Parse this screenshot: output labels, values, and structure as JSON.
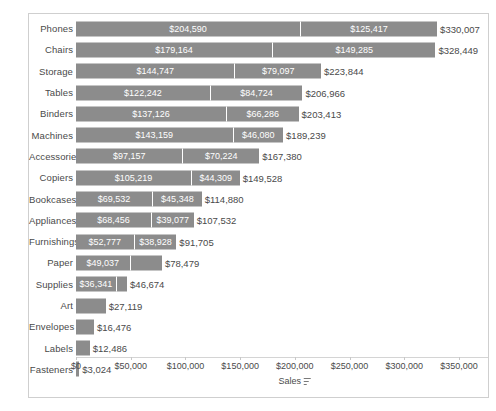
{
  "chart_data": {
    "type": "bar",
    "orientation": "horizontal",
    "stacked": true,
    "title": "",
    "xlabel": "Sales",
    "ylabel": "",
    "xlim": [
      0,
      350000
    ],
    "grid": false,
    "legend": null,
    "axis_sort_icon": "sort-descending-icon",
    "tick_labels": [
      "$0",
      "$50,000",
      "$100,000",
      "$150,000",
      "$200,000",
      "$250,000",
      "$300,000",
      "$350,000"
    ],
    "tick_values": [
      0,
      50000,
      100000,
      150000,
      200000,
      250000,
      300000,
      350000
    ],
    "bar_color": "#8c8c8c",
    "categories": [
      "Phones",
      "Chairs",
      "Storage",
      "Tables",
      "Binders",
      "Machines",
      "Accessories",
      "Copiers",
      "Bookcases",
      "Appliances",
      "Furnishings",
      "Paper",
      "Supplies",
      "Art",
      "Envelopes",
      "Labels",
      "Fasteners"
    ],
    "rows": [
      {
        "category": "Phones",
        "segments": [
          204590,
          125417
        ],
        "segment_labels": [
          "$204,590",
          "$125,417"
        ],
        "total": 330007,
        "total_label": "$330,007"
      },
      {
        "category": "Chairs",
        "segments": [
          179164,
          149285
        ],
        "segment_labels": [
          "$179,164",
          "$149,285"
        ],
        "total": 328449,
        "total_label": "$328,449"
      },
      {
        "category": "Storage",
        "segments": [
          144747,
          79097
        ],
        "segment_labels": [
          "$144,747",
          "$79,097"
        ],
        "total": 223844,
        "total_label": "$223,844"
      },
      {
        "category": "Tables",
        "segments": [
          122242,
          84724
        ],
        "segment_labels": [
          "$122,242",
          "$84,724"
        ],
        "total": 206966,
        "total_label": "$206,966"
      },
      {
        "category": "Binders",
        "segments": [
          137126,
          66286
        ],
        "segment_labels": [
          "$137,126",
          "$66,286"
        ],
        "total": 203413,
        "total_label": "$203,413"
      },
      {
        "category": "Machines",
        "segments": [
          143159,
          46080
        ],
        "segment_labels": [
          "$143,159",
          "$46,080"
        ],
        "total": 189239,
        "total_label": "$189,239"
      },
      {
        "category": "Accessories",
        "segments": [
          97157,
          70224
        ],
        "segment_labels": [
          "$97,157",
          "$70,224"
        ],
        "total": 167380,
        "total_label": "$167,380"
      },
      {
        "category": "Copiers",
        "segments": [
          105219,
          44309
        ],
        "segment_labels": [
          "$105,219",
          "$44,309"
        ],
        "total": 149528,
        "total_label": "$149,528"
      },
      {
        "category": "Bookcases",
        "segments": [
          69532,
          45348
        ],
        "segment_labels": [
          "$69,532",
          "$45,348"
        ],
        "total": 114880,
        "total_label": "$114,880"
      },
      {
        "category": "Appliances",
        "segments": [
          68456,
          39077
        ],
        "segment_labels": [
          "$68,456",
          "$39,077"
        ],
        "total": 107532,
        "total_label": "$107,532"
      },
      {
        "category": "Furnishings",
        "segments": [
          52777,
          38928
        ],
        "segment_labels": [
          "$52,777",
          "$38,928"
        ],
        "total": 91705,
        "total_label": "$91,705"
      },
      {
        "category": "Paper",
        "segments": [
          49037,
          29442
        ],
        "segment_labels": [
          "$49,037",
          ""
        ],
        "total": 78479,
        "total_label": "$78,479"
      },
      {
        "category": "Supplies",
        "segments": [
          36341,
          10333
        ],
        "segment_labels": [
          "$36,341",
          ""
        ],
        "total": 46674,
        "total_label": "$46,674"
      },
      {
        "category": "Art",
        "segments": [
          27119
        ],
        "segment_labels": [
          ""
        ],
        "total": 27119,
        "total_label": "$27,119"
      },
      {
        "category": "Envelopes",
        "segments": [
          16476
        ],
        "segment_labels": [
          ""
        ],
        "total": 16476,
        "total_label": "$16,476"
      },
      {
        "category": "Labels",
        "segments": [
          12486
        ],
        "segment_labels": [
          ""
        ],
        "total": 12486,
        "total_label": "$12,486"
      },
      {
        "category": "Fasteners",
        "segments": [
          3024
        ],
        "segment_labels": [
          ""
        ],
        "total": 3024,
        "total_label": "$3,024"
      }
    ]
  }
}
